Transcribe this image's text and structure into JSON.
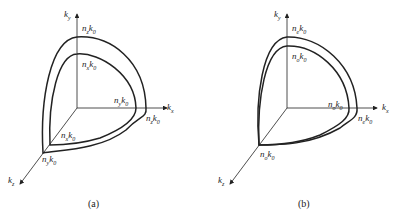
{
  "panels": [
    {
      "caption": "(a)",
      "axes": {
        "y": {
          "base": "k",
          "sub": "y"
        },
        "x": {
          "base": "k",
          "sub": "x"
        },
        "z": {
          "base": "k",
          "sub": "z"
        }
      },
      "labels": {
        "y_outer": {
          "n": "z",
          "k": "0"
        },
        "y_inner": {
          "n": "x",
          "k": "0"
        },
        "x_inner": {
          "n": "y",
          "k": "0"
        },
        "x_outer": {
          "n": "z",
          "k": "0"
        },
        "z_inner": {
          "n": "x",
          "k": "0"
        },
        "z_outer": {
          "n": "y",
          "k": "0"
        }
      }
    },
    {
      "caption": "(b)",
      "axes": {
        "y": {
          "base": "k",
          "sub": "y"
        },
        "x": {
          "base": "k",
          "sub": "x"
        },
        "z": {
          "base": "k",
          "sub": "z"
        }
      },
      "labels": {
        "y_outer": {
          "n": "e",
          "k": "0"
        },
        "y_inner": {
          "n": "o",
          "k": "0"
        },
        "x_inner": {
          "n": "o",
          "k": "0"
        },
        "x_outer": {
          "n": "e",
          "k": "0"
        },
        "z": {
          "n": "o",
          "k": "0"
        }
      }
    }
  ],
  "letters": {
    "n": "n",
    "k": "k"
  }
}
